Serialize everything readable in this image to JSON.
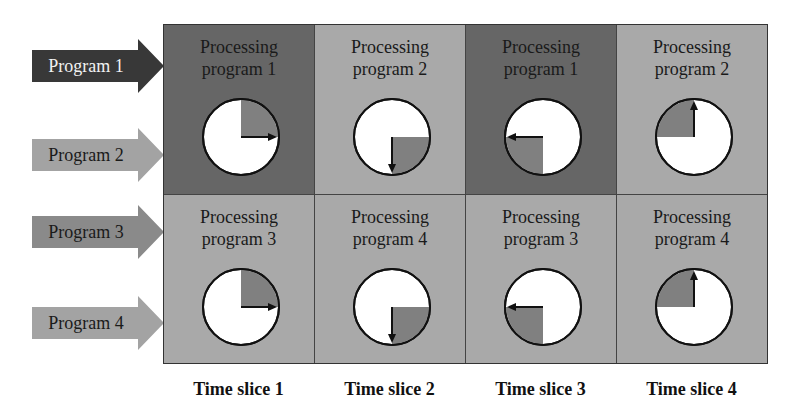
{
  "colors": {
    "dark_cell": "#666666",
    "light_cell": "#a9a9a9",
    "arrow_dark": "#3a3a3a",
    "arrow_light": "#9f9f9f",
    "arrow_mid": "#8a8a8a",
    "pie_slice": "#808080",
    "clock_face": "#ffffff"
  },
  "programs": [
    {
      "label": "Program 1"
    },
    {
      "label": "Program 2"
    },
    {
      "label": "Program 3"
    },
    {
      "label": "Program 4"
    }
  ],
  "cells": [
    [
      {
        "line1": "Processing",
        "line2": "program 1"
      },
      {
        "line1": "Processing",
        "line2": "program 2"
      },
      {
        "line1": "Processing",
        "line2": "program 1"
      },
      {
        "line1": "Processing",
        "line2": "program 2"
      }
    ],
    [
      {
        "line1": "Processing",
        "line2": "program 3"
      },
      {
        "line1": "Processing",
        "line2": "program 4"
      },
      {
        "line1": "Processing",
        "line2": "program 3"
      },
      {
        "line1": "Processing",
        "line2": "program 4"
      }
    ]
  ],
  "time_slices": [
    "Time slice 1",
    "Time slice 2",
    "Time slice 3",
    "Time slice 4"
  ]
}
